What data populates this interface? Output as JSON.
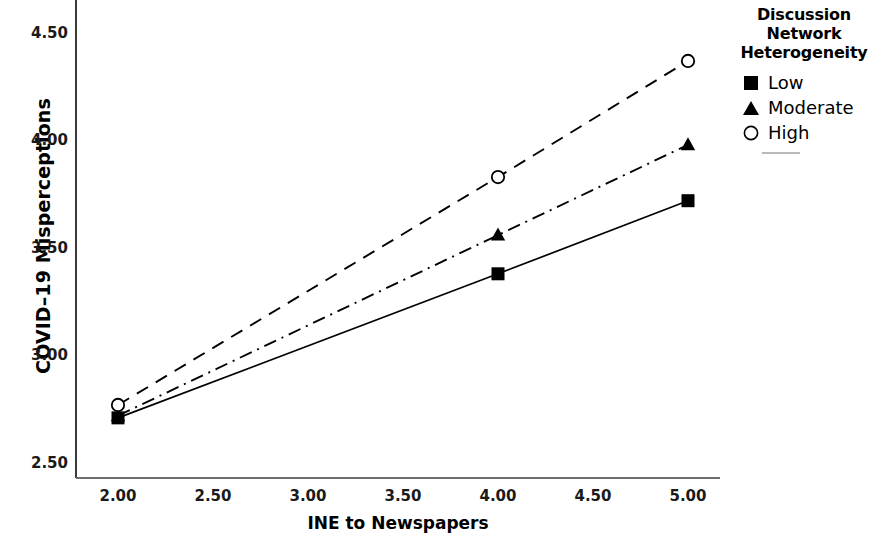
{
  "chart_data": {
    "type": "line",
    "title": "",
    "xlabel": "INE to Newspapers",
    "ylabel": "COVID–19 Misperceptions",
    "x": [
      2.0,
      4.0,
      5.0
    ],
    "xlim": [
      1.75,
      5.25
    ],
    "ylim": [
      2.39,
      4.6
    ],
    "xticks": [
      "2.00",
      "2.50",
      "3.00",
      "3.50",
      "4.00",
      "4.50",
      "5.00"
    ],
    "xtick_values": [
      2.0,
      2.5,
      3.0,
      3.5,
      4.0,
      4.5,
      5.0
    ],
    "yticks": [
      "2.50",
      "3.00",
      "3.50",
      "4.00",
      "4.50"
    ],
    "ytick_values": [
      2.5,
      3.0,
      3.5,
      4.0,
      4.5
    ],
    "grid": false,
    "legend_position": "right",
    "legend_title": "Discussion Network Heterogeneity",
    "series": [
      {
        "name": "Low",
        "marker": "filled-square",
        "linestyle": "solid",
        "color": "#000000",
        "values": [
          2.71,
          3.38,
          3.72
        ]
      },
      {
        "name": "Moderate",
        "marker": "filled-triangle",
        "linestyle": "dash-dot",
        "color": "#000000",
        "values": [
          2.72,
          3.56,
          3.98
        ]
      },
      {
        "name": "High",
        "marker": "open-circle",
        "linestyle": "dashed",
        "color": "#000000",
        "values": [
          2.77,
          3.83,
          4.37
        ]
      }
    ]
  },
  "axes": {
    "y_label": "COVID–19 Misperceptions",
    "x_label": "INE to Newspapers",
    "y_ticks": [
      "4.50",
      "4.00",
      "3.50",
      "3.00",
      "2.50"
    ],
    "x_ticks": [
      "2.00",
      "2.50",
      "3.00",
      "3.50",
      "4.00",
      "4.50",
      "5.00"
    ]
  },
  "legend": {
    "title_line1": "Discussion",
    "title_line2": "Network",
    "title_line3": "Heterogeneity",
    "items": [
      {
        "label": "Low",
        "marker": "filled-square"
      },
      {
        "label": "Moderate",
        "marker": "filled-triangle"
      },
      {
        "label": "High",
        "marker": "open-circle"
      }
    ]
  }
}
